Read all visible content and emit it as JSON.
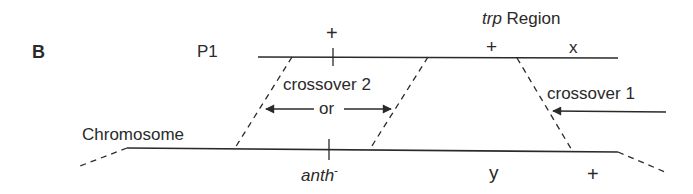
{
  "panel_label": "B",
  "top_strand": {
    "name": "P1",
    "markers": [
      {
        "label": "+",
        "position": "left-tick"
      },
      {
        "label": "+",
        "position": "trp-left"
      },
      {
        "label": "x",
        "position": "trp-right"
      }
    ]
  },
  "region_label": {
    "italic": "trp",
    "text": " Region"
  },
  "bottom_strand": {
    "name": "Chromosome",
    "markers": [
      {
        "label": "anth",
        "superscript": "-",
        "italic": true
      },
      {
        "label": "y"
      },
      {
        "label": "+"
      }
    ]
  },
  "crossovers": [
    {
      "label": "crossover 2",
      "connector": "or"
    },
    {
      "label": "crossover 1"
    }
  ],
  "colors": {
    "ink": "#2a2a2a",
    "background": "#ffffff"
  }
}
